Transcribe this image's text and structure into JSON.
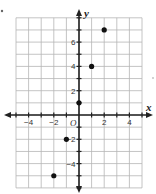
{
  "chart_data": {
    "type": "scatter",
    "title": "",
    "xlabel": "x",
    "ylabel": "y",
    "origin_label": "O",
    "xlim": [
      -5,
      5
    ],
    "ylim": [
      -6,
      8
    ],
    "grid": true,
    "x_ticks": [
      -4,
      -2,
      2,
      4
    ],
    "y_ticks": [
      6,
      4,
      2,
      -2,
      -4
    ],
    "x_tick_labels": [
      "−4",
      "−2",
      "2",
      "4"
    ],
    "y_tick_labels": [
      "6",
      "4",
      "2",
      "−2",
      "−4"
    ],
    "points": [
      {
        "x": -2,
        "y": -5
      },
      {
        "x": -1,
        "y": -2
      },
      {
        "x": 0,
        "y": 1
      },
      {
        "x": 1,
        "y": 4
      },
      {
        "x": 2,
        "y": 7
      }
    ],
    "colors": {
      "grid": "#b5b5b5",
      "axis": "#222222",
      "point": "#111111"
    }
  }
}
